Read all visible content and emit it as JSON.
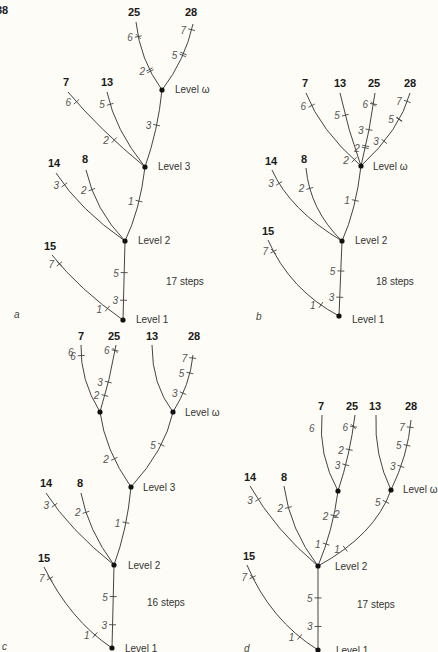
{
  "page_number": "38",
  "panels": [
    {
      "id": "a",
      "letter": "a",
      "steps_label": "17 steps",
      "steps_pos": [
        166,
        285
      ],
      "letter_pos": [
        14,
        318
      ],
      "nodes": [
        {
          "id": "L1",
          "x": 123,
          "y": 320,
          "label": "Level 1",
          "lx": 136,
          "ly": 323
        },
        {
          "id": "L2",
          "x": 125,
          "y": 241,
          "label": "Level 2",
          "lx": 138,
          "ly": 244
        },
        {
          "id": "L3",
          "x": 145,
          "y": 167,
          "label": "Level 3",
          "lx": 158,
          "ly": 170
        },
        {
          "id": "Lw",
          "x": 162,
          "y": 90,
          "label": "Level ω",
          "lx": 175,
          "ly": 93
        }
      ],
      "branches": [
        {
          "d": "M123,320 L125,241",
          "marks": [
            {
              "t": 0.25,
              "label": "3"
            },
            {
              "t": 0.6,
              "label": "5"
            }
          ]
        },
        {
          "d": "M123,320 Q80,290 52,255",
          "taxon": "15",
          "tx": 44,
          "ty": 250,
          "marks": [
            {
              "t": 0.2,
              "label": "1"
            },
            {
              "t": 0.88,
              "label": "7",
              "cross": true
            }
          ]
        },
        {
          "d": "M125,241 Q80,210 56,173",
          "taxon": "14",
          "tx": 48,
          "ty": 167,
          "marks": [
            {
              "t": 0.85,
              "label": "3"
            }
          ]
        },
        {
          "d": "M125,241 Q95,210 86,170",
          "taxon": "8",
          "tx": 82,
          "ty": 163,
          "marks": [
            {
              "t": 0.75,
              "label": "2"
            }
          ]
        },
        {
          "d": "M125,241 Q140,210 145,167",
          "marks": [
            {
              "t": 0.55,
              "label": "1"
            }
          ]
        },
        {
          "d": "M145,167 Q100,130 68,92",
          "taxon": "7",
          "tx": 63,
          "ty": 86,
          "marks": [
            {
              "t": 0.38,
              "label": "2"
            },
            {
              "t": 0.88,
              "label": "6"
            }
          ]
        },
        {
          "d": "M145,167 Q115,130 107,92",
          "taxon": "13",
          "tx": 101,
          "ty": 86,
          "marks": [
            {
              "t": 0.85,
              "label": "5"
            }
          ]
        },
        {
          "d": "M145,167 Q158,130 162,90",
          "marks": [
            {
              "t": 0.55,
              "label": "3"
            }
          ]
        },
        {
          "d": "M162,90 Q140,60 136,22",
          "taxon": "25",
          "tx": 128,
          "ty": 16,
          "marks": [
            {
              "t": 0.3,
              "label": "2",
              "double": true
            },
            {
              "t": 0.8,
              "label": "6",
              "cross": true
            }
          ]
        },
        {
          "d": "M162,90 Q185,60 193,24",
          "taxon": "28",
          "tx": 185,
          "ty": 16,
          "marks": [
            {
              "t": 0.55,
              "label": "5",
              "double": true
            },
            {
              "t": 0.92,
              "label": "7"
            }
          ]
        }
      ]
    },
    {
      "id": "b",
      "letter": "b",
      "steps_label": "18 steps",
      "steps_pos": [
        376,
        285
      ],
      "letter_pos": [
        256,
        320
      ],
      "nodes": [
        {
          "id": "L1",
          "x": 339,
          "y": 316,
          "label": "Level 1",
          "lx": 352,
          "ly": 323
        },
        {
          "id": "L2",
          "x": 342,
          "y": 241,
          "label": "Level 2",
          "lx": 355,
          "ly": 244
        },
        {
          "id": "Lw",
          "x": 361,
          "y": 166,
          "label": "Level ω",
          "lx": 373,
          "ly": 170
        }
      ],
      "branches": [
        {
          "d": "M339,316 L342,241",
          "marks": [
            {
              "t": 0.25,
              "label": "3"
            },
            {
              "t": 0.6,
              "label": "5"
            }
          ]
        },
        {
          "d": "M339,316 Q290,290 268,240",
          "taxon": "15",
          "tx": 262,
          "ty": 235,
          "marks": [
            {
              "t": 0.2,
              "label": "1"
            },
            {
              "t": 0.88,
              "label": "7",
              "cross": true
            }
          ]
        },
        {
          "d": "M342,241 Q290,210 272,170",
          "taxon": "14",
          "tx": 265,
          "ty": 165,
          "marks": [
            {
              "t": 0.85,
              "label": "3"
            }
          ]
        },
        {
          "d": "M342,241 Q310,210 306,168",
          "taxon": "8",
          "tx": 301,
          "ty": 163,
          "marks": [
            {
              "t": 0.75,
              "label": "2"
            }
          ]
        },
        {
          "d": "M342,241 Q356,210 361,166",
          "marks": [
            {
              "t": 0.55,
              "label": "1"
            }
          ]
        },
        {
          "d": "M361,166 Q320,130 306,93",
          "taxon": "7",
          "tx": 302,
          "ty": 87,
          "marks": [
            {
              "t": 0.1,
              "label": "2"
            },
            {
              "t": 0.85,
              "label": "6"
            }
          ]
        },
        {
          "d": "M361,166 Q348,130 340,93",
          "taxon": "13",
          "tx": 334,
          "ty": 87,
          "marks": [
            {
              "t": 0.7,
              "label": "5"
            }
          ]
        },
        {
          "d": "M361,166 Q370,130 375,93",
          "taxon": "25",
          "tx": 368,
          "ty": 87,
          "marks": [
            {
              "t": 0.25,
              "label": "2",
              "double": true
            },
            {
              "t": 0.5,
              "label": "3"
            },
            {
              "t": 0.85,
              "label": "6",
              "cross": true
            }
          ]
        },
        {
          "d": "M361,166 Q400,130 410,93",
          "taxon": "28",
          "tx": 404,
          "ty": 87,
          "marks": [
            {
              "t": 0.38,
              "label": "3"
            },
            {
              "t": 0.68,
              "label": "5",
              "cross": true
            },
            {
              "t": 0.9,
              "label": "7"
            }
          ]
        }
      ]
    },
    {
      "id": "c",
      "letter": "c",
      "steps_label": "16 steps",
      "steps_pos": [
        147,
        606
      ],
      "letter_pos": [
        2,
        650
      ],
      "nodes": [
        {
          "id": "L1",
          "x": 112,
          "y": 648,
          "label": "Level 1",
          "lx": 125,
          "ly": 652
        },
        {
          "id": "L2",
          "x": 114,
          "y": 565,
          "label": "Level 2",
          "lx": 128,
          "ly": 569
        },
        {
          "id": "L3",
          "x": 131,
          "y": 487,
          "label": "Level 3",
          "lx": 143,
          "ly": 491
        },
        {
          "id": "Lw1",
          "x": 100,
          "y": 412
        },
        {
          "id": "Lw2",
          "x": 173,
          "y": 412,
          "label": "Level ω",
          "lx": 185,
          "ly": 416
        }
      ],
      "branches": [
        {
          "d": "M112,648 L114,565",
          "marks": [
            {
              "t": 0.28,
              "label": "3"
            },
            {
              "t": 0.62,
              "label": "5"
            }
          ]
        },
        {
          "d": "M112,648 Q70,620 44,567",
          "taxon": "15",
          "tx": 38,
          "ty": 562,
          "marks": [
            {
              "t": 0.2,
              "label": "1"
            },
            {
              "t": 0.88,
              "label": "7",
              "cross": true
            }
          ]
        },
        {
          "d": "M114,565 Q70,530 46,493",
          "taxon": "14",
          "tx": 40,
          "ty": 487,
          "marks": [
            {
              "t": 0.85,
              "label": "3"
            }
          ]
        },
        {
          "d": "M114,565 Q88,530 81,493",
          "taxon": "8",
          "tx": 77,
          "ty": 487,
          "marks": [
            {
              "t": 0.75,
              "label": "2"
            }
          ]
        },
        {
          "d": "M114,565 Q127,530 131,487",
          "marks": [
            {
              "t": 0.55,
              "label": "1"
            }
          ]
        },
        {
          "d": "M131,487 Q105,450 100,412",
          "marks": [
            {
              "t": 0.4,
              "label": "2"
            }
          ]
        },
        {
          "d": "M131,487 Q165,450 173,412",
          "marks": [
            {
              "t": 0.6,
              "label": "5"
            }
          ]
        },
        {
          "d": "M100,412 Q80,380 81,345",
          "taxon": "7",
          "tx": 78,
          "ty": 340,
          "marks": [
            {
              "t": 0.85,
              "label": "6"
            }
          ]
        },
        {
          "d": "M100,412 Q110,380 116,345",
          "taxon": "25",
          "tx": 108,
          "ty": 340,
          "marks": [
            {
              "t": 0.25,
              "label": "2"
            },
            {
              "t": 0.45,
              "label": "3"
            },
            {
              "t": 0.92,
              "label": "6",
              "cross": true
            }
          ]
        },
        {
          "d": "M173,412 Q152,385 152,345",
          "taxon": "13",
          "tx": 146,
          "ty": 340,
          "marks": []
        },
        {
          "d": "M173,412 Q190,385 193,355",
          "taxon": "28",
          "tx": 188,
          "ty": 340,
          "marks": [
            {
              "t": 0.35,
              "label": "3"
            },
            {
              "t": 0.7,
              "label": "5"
            },
            {
              "t": 0.95,
              "label": "7"
            }
          ]
        }
      ]
    },
    {
      "id": "d",
      "letter": "d",
      "steps_label": "17 steps",
      "steps_pos": [
        357,
        608
      ],
      "letter_pos": [
        244,
        652
      ],
      "nodes": [
        {
          "id": "L1",
          "x": 318,
          "y": 650,
          "label": "Level 1",
          "lx": 336,
          "ly": 654
        },
        {
          "id": "L2",
          "x": 318,
          "y": 566,
          "label": "Level 2",
          "lx": 335,
          "ly": 570
        },
        {
          "id": "Lw1",
          "x": 338,
          "y": 491
        },
        {
          "id": "Lw2",
          "x": 391,
          "y": 490,
          "label": "Level ω",
          "lx": 403,
          "ly": 493
        }
      ],
      "branches": [
        {
          "d": "M318,650 L318,566",
          "marks": [
            {
              "t": 0.28,
              "label": "3"
            },
            {
              "t": 0.62,
              "label": "5"
            }
          ]
        },
        {
          "d": "M318,650 Q270,620 247,565",
          "taxon": "15",
          "tx": 243,
          "ty": 560,
          "marks": [
            {
              "t": 0.2,
              "label": "1"
            },
            {
              "t": 0.88,
              "label": "7",
              "cross": true
            }
          ]
        },
        {
          "d": "M318,566 Q275,530 250,486",
          "taxon": "14",
          "tx": 244,
          "ty": 481,
          "marks": [
            {
              "t": 0.85,
              "label": "3"
            }
          ]
        },
        {
          "d": "M318,566 Q290,530 284,486",
          "taxon": "8",
          "tx": 281,
          "ty": 481,
          "marks": [
            {
              "t": 0.75,
              "label": "2"
            }
          ]
        },
        {
          "d": "M318,566 Q333,530 338,491",
          "marks": [
            {
              "t": 0.3,
              "label": "1"
            },
            {
              "t": 0.68,
              "label": "2"
            }
          ]
        },
        {
          "d": "M318,566 Q375,535 391,490",
          "marks": [
            {
              "t": 0.3,
              "label": "1"
            },
            {
              "t": 0.88,
              "label": "5"
            }
          ]
        },
        {
          "d": "M338,491 Q318,455 322,415",
          "taxon": "7",
          "tx": 318,
          "ty": 410,
          "marks": []
        },
        {
          "d": "M338,491 Q350,455 355,415",
          "taxon": "25",
          "tx": 346,
          "ty": 410,
          "marks": [
            {
              "t": 0.35,
              "label": "3"
            },
            {
              "t": 0.55,
              "label": "2"
            },
            {
              "t": 0.85,
              "label": "6",
              "cross": true
            }
          ]
        },
        {
          "d": "M391,490 Q374,455 376,415",
          "taxon": "13",
          "tx": 369,
          "ty": 410,
          "marks": []
        },
        {
          "d": "M391,490 Q408,455 411,420",
          "taxon": "28",
          "tx": 405,
          "ty": 410,
          "marks": [
            {
              "t": 0.35,
              "label": "3"
            },
            {
              "t": 0.65,
              "label": "5"
            },
            {
              "t": 0.9,
              "label": "7"
            }
          ]
        }
      ]
    }
  ],
  "extra_tick_labels": {
    "c": [
      {
        "label": "6",
        "x": 68,
        "y": 356
      }
    ],
    "d": [
      {
        "label": "6",
        "x": 309,
        "y": 432
      },
      {
        "label": "2",
        "x": 334,
        "y": 518
      }
    ]
  }
}
